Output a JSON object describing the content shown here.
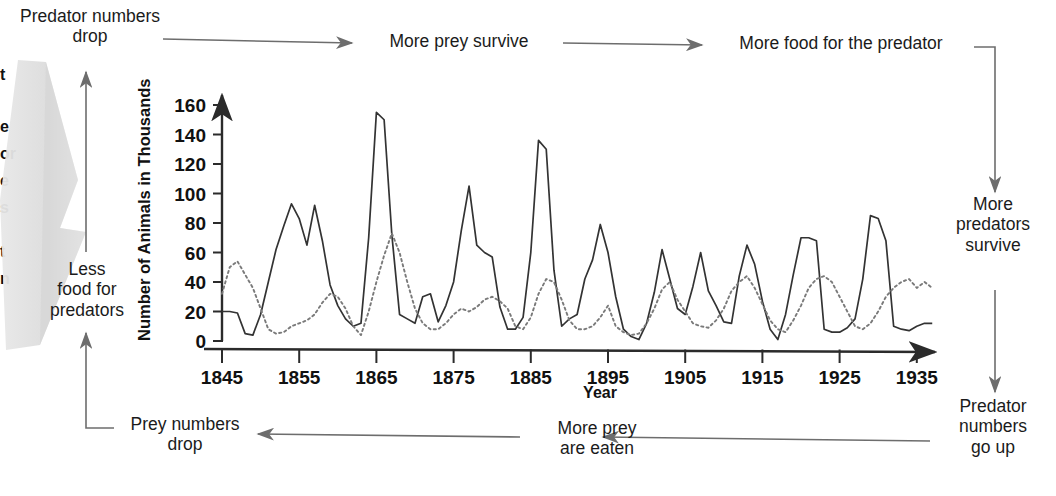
{
  "diagram": {
    "nodes": [
      {
        "id": "predator-numbers-drop",
        "label": "Predator numbers\ndrop",
        "line1": "Predator numbers",
        "line2": "drop"
      },
      {
        "id": "more-prey-survive",
        "label": "More prey survive",
        "line1": "More prey survive",
        "line2": ""
      },
      {
        "id": "more-food-for-the-predator",
        "label": "More food for the predator",
        "line1": "More food for the predator",
        "line2": ""
      },
      {
        "id": "more-predators-survive",
        "label": "More\npredators\nsurvive",
        "line1": "More",
        "line2": "predators",
        "line3": "survive"
      },
      {
        "id": "predator-numbers-go-up",
        "label": "Predator\nnumbers\ngo up",
        "line1": "Predator",
        "line2": "numbers",
        "line3": "go up"
      },
      {
        "id": "more-prey-are-eaten",
        "label": "More prey\nare eaten",
        "line1": "More prey",
        "line2": "are eaten"
      },
      {
        "id": "prey-numbers-drop",
        "label": "Prey numbers\ndrop",
        "line1": "Prey numbers",
        "line2": "drop"
      },
      {
        "id": "less-food-for-predators",
        "label": "Less\nfood for\npredators",
        "line1": "Less",
        "line2": "food for",
        "line3": "predators"
      }
    ],
    "edge_fragments": [
      "t",
      "e",
      "or",
      "e",
      "s",
      "t",
      "n"
    ],
    "arrow_color": "#6b6b6b"
  },
  "chart_data": {
    "type": "line",
    "title": "",
    "xlabel": "Year",
    "ylabel": "Number of Animals in Thousands",
    "xlim": [
      1845,
      1938
    ],
    "ylim": [
      0,
      168
    ],
    "grid": false,
    "legend": "none",
    "ytick_labels": [
      "0",
      "20",
      "40",
      "60",
      "80",
      "100",
      "120",
      "140",
      "160"
    ],
    "ytick_values": [
      0,
      20,
      40,
      60,
      80,
      100,
      120,
      140,
      160
    ],
    "xtick_labels": [
      "1845",
      "1855",
      "1865",
      "1875",
      "1885",
      "1895",
      "1905",
      "1915",
      "1925",
      "1935"
    ],
    "xtick_values": [
      1845,
      1855,
      1865,
      1875,
      1885,
      1895,
      1905,
      1915,
      1925,
      1935
    ],
    "series": [
      {
        "name": "prey",
        "style": "solid",
        "color": "#333333",
        "x": [
          1845,
          1846,
          1847,
          1848,
          1849,
          1850,
          1851,
          1852,
          1853,
          1854,
          1855,
          1856,
          1857,
          1858,
          1859,
          1860,
          1861,
          1862,
          1863,
          1864,
          1865,
          1866,
          1867,
          1868,
          1869,
          1870,
          1871,
          1872,
          1873,
          1874,
          1875,
          1876,
          1877,
          1878,
          1879,
          1880,
          1881,
          1882,
          1883,
          1884,
          1885,
          1886,
          1887,
          1888,
          1889,
          1890,
          1891,
          1892,
          1893,
          1894,
          1895,
          1896,
          1897,
          1898,
          1899,
          1900,
          1901,
          1902,
          1903,
          1904,
          1905,
          1906,
          1907,
          1908,
          1909,
          1910,
          1911,
          1912,
          1913,
          1914,
          1915,
          1916,
          1917,
          1918,
          1919,
          1920,
          1921,
          1922,
          1923,
          1924,
          1925,
          1926,
          1927,
          1928,
          1929,
          1930,
          1931,
          1932,
          1933,
          1934,
          1935,
          1936,
          1937
        ],
        "values": [
          20,
          20,
          19,
          5,
          4,
          18,
          40,
          62,
          78,
          93,
          83,
          65,
          92,
          68,
          38,
          24,
          15,
          10,
          12,
          70,
          155,
          150,
          72,
          18,
          15,
          12,
          30,
          32,
          13,
          24,
          40,
          75,
          105,
          65,
          60,
          57,
          23,
          8,
          8,
          16,
          60,
          136,
          130,
          48,
          10,
          15,
          18,
          42,
          55,
          79,
          60,
          30,
          8,
          3,
          1,
          12,
          33,
          62,
          42,
          22,
          18,
          37,
          60,
          34,
          24,
          13,
          12,
          44,
          65,
          52,
          27,
          8,
          1,
          18,
          45,
          70,
          70,
          68,
          8,
          6,
          6,
          9,
          15,
          42,
          85,
          83,
          68,
          10,
          8,
          7,
          10,
          12,
          12
        ]
      },
      {
        "name": "predator",
        "style": "dotted",
        "color": "#7a7a7a",
        "x": [
          1845,
          1846,
          1847,
          1848,
          1849,
          1850,
          1851,
          1852,
          1853,
          1854,
          1855,
          1856,
          1857,
          1858,
          1859,
          1860,
          1861,
          1862,
          1863,
          1864,
          1865,
          1866,
          1867,
          1868,
          1869,
          1870,
          1871,
          1872,
          1873,
          1874,
          1875,
          1876,
          1877,
          1878,
          1879,
          1880,
          1881,
          1882,
          1883,
          1884,
          1885,
          1886,
          1887,
          1888,
          1889,
          1890,
          1891,
          1892,
          1893,
          1894,
          1895,
          1896,
          1897,
          1898,
          1899,
          1900,
          1901,
          1902,
          1903,
          1904,
          1905,
          1906,
          1907,
          1908,
          1909,
          1910,
          1911,
          1912,
          1913,
          1914,
          1915,
          1916,
          1917,
          1918,
          1919,
          1920,
          1921,
          1922,
          1923,
          1924,
          1925,
          1926,
          1927,
          1928,
          1929,
          1930,
          1931,
          1932,
          1933,
          1934,
          1935,
          1936,
          1937
        ],
        "values": [
          32,
          50,
          54,
          45,
          36,
          22,
          8,
          5,
          6,
          10,
          12,
          14,
          18,
          26,
          32,
          30,
          22,
          10,
          4,
          20,
          40,
          58,
          73,
          60,
          40,
          22,
          12,
          8,
          8,
          12,
          18,
          22,
          20,
          23,
          28,
          30,
          27,
          22,
          10,
          8,
          16,
          32,
          42,
          40,
          28,
          14,
          8,
          8,
          10,
          16,
          24,
          10,
          6,
          4,
          5,
          12,
          22,
          35,
          40,
          28,
          20,
          12,
          10,
          9,
          14,
          22,
          34,
          40,
          44,
          36,
          25,
          14,
          8,
          6,
          14,
          24,
          36,
          42,
          44,
          40,
          30,
          20,
          10,
          8,
          12,
          20,
          30,
          36,
          40,
          42,
          36,
          40,
          36
        ]
      }
    ]
  }
}
